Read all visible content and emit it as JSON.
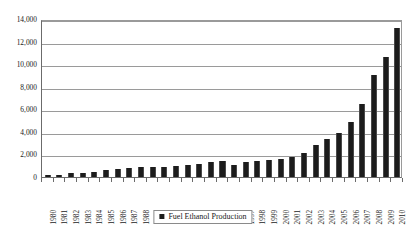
{
  "chart_data": {
    "type": "bar",
    "title": "",
    "subtitle": "",
    "xlabel": "",
    "ylabel": "",
    "grid": true,
    "legend_position": "bottom-center",
    "ylim": [
      0,
      14000
    ],
    "ytick_labels": [
      "14,000",
      "12,000",
      "10,000",
      "8,000",
      "6,000",
      "4,000",
      "2,000",
      "0"
    ],
    "ytick_values": [
      14000,
      12000,
      10000,
      8000,
      6000,
      4000,
      2000,
      0
    ],
    "categories": [
      "1980",
      "1981",
      "1982",
      "1983",
      "1984",
      "1985",
      "1986",
      "1987",
      "1988",
      "1989",
      "1990",
      "1991",
      "1992",
      "1993",
      "1994",
      "1995",
      "1996",
      "1997",
      "1998",
      "1999",
      "2000",
      "2001",
      "2002",
      "2003",
      "2004",
      "2005",
      "2006",
      "2007",
      "2008",
      "2009",
      "2010"
    ],
    "series": [
      {
        "name": "Fuel Ethanol Production",
        "color": "#1c1c1c",
        "values": [
          175,
          215,
          350,
          375,
          430,
          610,
          710,
          830,
          845,
          860,
          900,
          950,
          1050,
          1150,
          1350,
          1400,
          1100,
          1300,
          1400,
          1470,
          1630,
          1770,
          2130,
          2800,
          3400,
          3900,
          4900,
          6500,
          9000,
          10600,
          13230
        ]
      }
    ]
  },
  "legend": {
    "label": "Fuel Ethanol Production",
    "marker": "filled-square"
  },
  "axes": {
    "y_axis_name": "y-axis",
    "x_axis_name": "x-axis"
  }
}
